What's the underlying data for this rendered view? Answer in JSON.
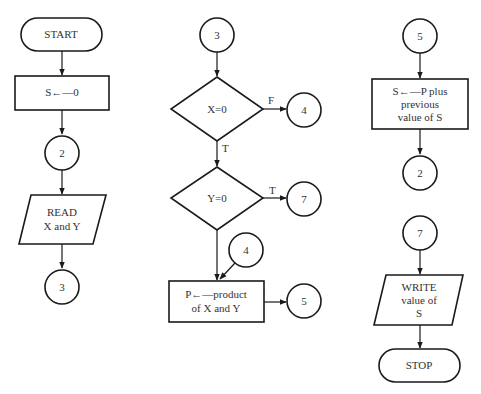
{
  "diagram": {
    "type": "flowchart",
    "colors": {
      "stroke": "#1a1a1a",
      "text": "#333333",
      "background": "#ffffff"
    },
    "columns": [
      {
        "id": "col1",
        "nodes": [
          {
            "id": "start",
            "shape": "terminal",
            "label": "START"
          },
          {
            "id": "init",
            "shape": "process",
            "label": "S←—0"
          },
          {
            "id": "conn2a",
            "shape": "connector",
            "label": "2"
          },
          {
            "id": "read",
            "shape": "io",
            "lines": [
              "READ",
              "X and Y"
            ]
          },
          {
            "id": "conn3a",
            "shape": "connector",
            "label": "3"
          }
        ]
      },
      {
        "id": "col2",
        "nodes": [
          {
            "id": "conn3b",
            "shape": "connector",
            "label": "3"
          },
          {
            "id": "decX",
            "shape": "decision",
            "label": "X=0"
          },
          {
            "id": "conn4a",
            "shape": "connector",
            "label": "4"
          },
          {
            "id": "decY",
            "shape": "decision",
            "label": "Y=0"
          },
          {
            "id": "conn7a",
            "shape": "connector",
            "label": "7"
          },
          {
            "id": "conn4b",
            "shape": "connector",
            "label": "4"
          },
          {
            "id": "prod",
            "shape": "process",
            "lines": [
              "P←—product",
              "of X and Y"
            ]
          },
          {
            "id": "conn5a",
            "shape": "connector",
            "label": "5"
          }
        ],
        "edge_labels": {
          "x_false": "F",
          "x_true": "T",
          "y_true": "T"
        }
      },
      {
        "id": "col3",
        "nodes": [
          {
            "id": "conn5b",
            "shape": "connector",
            "label": "5"
          },
          {
            "id": "sum",
            "shape": "process",
            "lines": [
              "S←—P plus",
              "previous",
              "value of S"
            ]
          },
          {
            "id": "conn2b",
            "shape": "connector",
            "label": "2"
          },
          {
            "id": "conn7b",
            "shape": "connector",
            "label": "7"
          },
          {
            "id": "write",
            "shape": "io",
            "lines": [
              "WRITE",
              "value of",
              "S"
            ]
          },
          {
            "id": "stop",
            "shape": "terminal",
            "label": "STOP"
          }
        ]
      }
    ]
  }
}
